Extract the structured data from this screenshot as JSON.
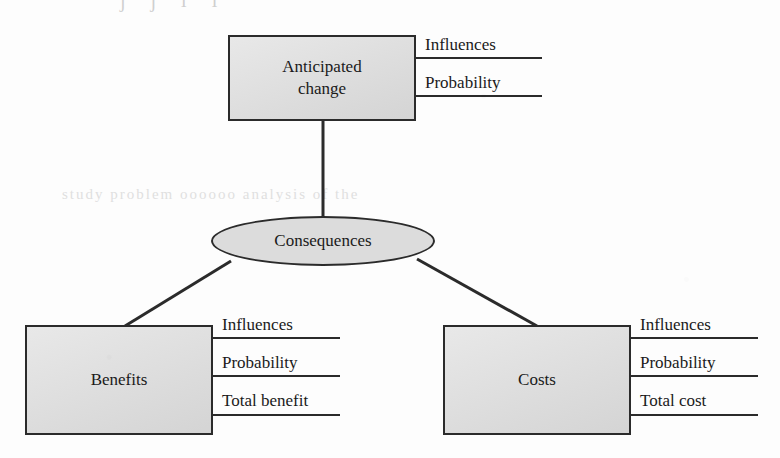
{
  "diagram": {
    "title_ghost": "j        j        i        i",
    "ghost_text_mid": "study  problem  oooooo  analysis  of   the",
    "nodes": {
      "anticipated_change": {
        "label": "Anticipated\nchange",
        "shape": "rectangle",
        "fill": "#dcdcdc"
      },
      "consequences": {
        "label": "Consequences",
        "shape": "ellipse",
        "fill": "#dcdcdc"
      },
      "benefits": {
        "label": "Benefits",
        "shape": "rectangle",
        "fill": "#dcdcdc"
      },
      "costs": {
        "label": "Costs",
        "shape": "rectangle",
        "fill": "#dcdcdc"
      }
    },
    "attributes": {
      "anticipated_change": [
        "Influences",
        "Probability"
      ],
      "benefits": [
        "Influences",
        "Probability",
        "Total benefit"
      ],
      "costs": [
        "Influences",
        "Probability",
        "Total cost"
      ]
    },
    "colors": {
      "node_fill": "#dcdcdc",
      "stroke": "#2b2b2b",
      "text": "#1a1a1a",
      "page": "#fdfdfd"
    },
    "edges": [
      {
        "from": "anticipated_change",
        "to": "consequences"
      },
      {
        "from": "consequences",
        "to": "benefits"
      },
      {
        "from": "consequences",
        "to": "costs"
      }
    ]
  }
}
